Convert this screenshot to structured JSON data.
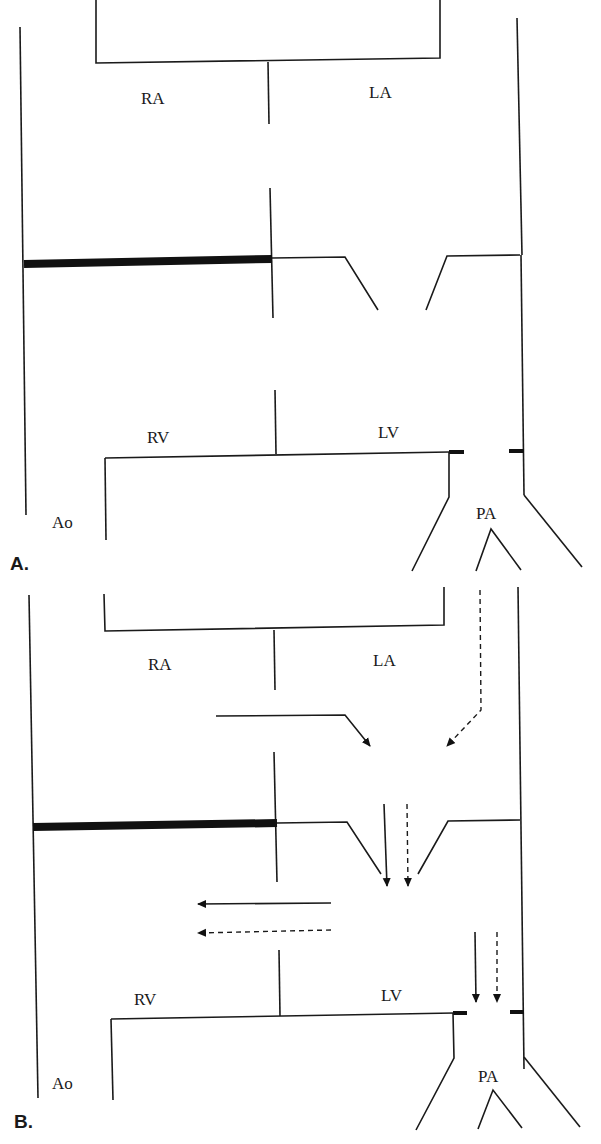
{
  "figure": {
    "panels": [
      {
        "id": "A",
        "label": "A.",
        "chambers": {
          "ra": "RA",
          "la": "LA",
          "rv": "RV",
          "lv": "LV",
          "ao": "Ao",
          "pa": "PA"
        }
      },
      {
        "id": "B",
        "label": "B.",
        "chambers": {
          "ra": "RA",
          "la": "LA",
          "rv": "RV",
          "lv": "LV",
          "ao": "Ao",
          "pa": "PA"
        },
        "arrows": {
          "solid": [
            "bent-to-center",
            "down-center",
            "left-shunt",
            "down-pa"
          ],
          "dashed": [
            "bent-from-right",
            "down-center",
            "left-shunt",
            "down-pa"
          ]
        }
      }
    ],
    "colors": {
      "line": "#1a1a1a",
      "background": "#ffffff"
    }
  }
}
